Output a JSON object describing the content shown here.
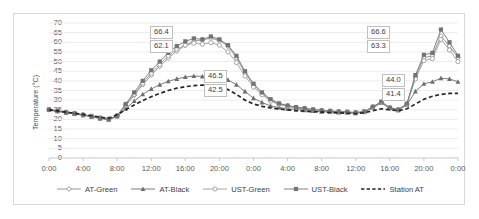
{
  "chart_data": {
    "type": "line",
    "title": "",
    "xlabel": "",
    "ylabel": "Temperature (°C)",
    "ylim": [
      0,
      70
    ],
    "ytick_step": 5,
    "yticks": [
      "70",
      "65",
      "60",
      "55",
      "50",
      "45",
      "40",
      "35",
      "30",
      "25",
      "20",
      "15",
      "10",
      "5",
      "0"
    ],
    "grid": true,
    "legend_position": "bottom",
    "xticks": [
      "0:00",
      "4:00",
      "8:00",
      "12:00",
      "16:00",
      "20:00",
      "0:00",
      "4:00",
      "8:00",
      "12:00",
      "16:00",
      "20:00",
      "0:00"
    ],
    "x_hours": [
      0,
      1,
      2,
      3,
      4,
      5,
      6,
      7,
      8,
      9,
      10,
      11,
      12,
      13,
      14,
      15,
      16,
      17,
      18,
      19,
      20,
      21,
      22,
      23,
      24,
      25,
      26,
      27,
      28,
      29,
      30,
      31,
      32,
      33,
      34,
      35,
      36,
      37,
      38,
      39,
      40,
      41,
      42,
      43,
      44,
      45,
      46,
      47,
      48
    ],
    "series": [
      {
        "name": "AT-Green",
        "marker": "open-diamond",
        "color": "#8c8c8c",
        "values": [
          25.0,
          24.3,
          23.6,
          23.0,
          22.4,
          21.6,
          20.7,
          20.1,
          21.8,
          27.0,
          32.5,
          38.0,
          43.0,
          47.5,
          51.8,
          55.5,
          58.4,
          60.5,
          61.3,
          62.1,
          61.0,
          58.0,
          52.0,
          44.0,
          38.0,
          33.5,
          30.0,
          28.0,
          27.0,
          26.2,
          25.6,
          25.0,
          24.6,
          24.3,
          24.0,
          23.8,
          23.5,
          24.0,
          26.5,
          29.0,
          26.0,
          25.0,
          28.0,
          42.0,
          52.0,
          53.0,
          63.3,
          58.0,
          52.0
        ]
      },
      {
        "name": "AT-Black",
        "marker": "filled-triangle",
        "color": "#6e6e6e",
        "values": [
          25.0,
          24.2,
          23.5,
          22.8,
          22.2,
          21.4,
          20.5,
          19.9,
          21.5,
          25.5,
          29.5,
          33.0,
          35.8,
          38.0,
          39.8,
          41.0,
          42.0,
          42.5,
          42.3,
          42.5,
          41.8,
          40.5,
          38.0,
          34.5,
          31.0,
          28.8,
          27.0,
          26.2,
          25.6,
          25.2,
          24.8,
          24.4,
          24.0,
          23.8,
          23.6,
          23.4,
          23.2,
          23.8,
          26.0,
          28.5,
          25.8,
          24.8,
          27.5,
          34.5,
          38.5,
          39.5,
          41.4,
          41.0,
          39.5
        ]
      },
      {
        "name": "UST-Green",
        "marker": "open-circle",
        "color": "#9e9e9e",
        "values": [
          25.2,
          24.5,
          23.8,
          23.2,
          22.5,
          21.8,
          20.9,
          20.3,
          22.0,
          27.5,
          33.0,
          38.8,
          44.0,
          48.5,
          53.0,
          56.5,
          58.5,
          59.5,
          59.0,
          59.8,
          58.5,
          55.0,
          49.5,
          42.5,
          36.8,
          32.8,
          29.5,
          27.8,
          26.8,
          26.0,
          25.4,
          24.9,
          24.5,
          24.2,
          23.9,
          23.7,
          23.4,
          23.9,
          26.3,
          28.8,
          25.9,
          24.9,
          27.8,
          41.0,
          50.5,
          51.5,
          61.5,
          56.0,
          50.0
        ]
      },
      {
        "name": "UST-Black",
        "marker": "filled-square",
        "color": "#737373",
        "values": [
          25.1,
          24.4,
          23.7,
          23.1,
          22.3,
          21.5,
          20.6,
          20.0,
          21.9,
          28.0,
          34.0,
          40.0,
          45.5,
          50.0,
          54.5,
          58.0,
          60.5,
          62.0,
          61.5,
          63.0,
          61.5,
          58.5,
          53.0,
          45.0,
          38.5,
          34.0,
          30.5,
          28.3,
          27.2,
          26.4,
          25.8,
          25.2,
          24.7,
          24.4,
          24.1,
          23.9,
          23.6,
          24.1,
          26.6,
          29.2,
          26.1,
          25.1,
          28.2,
          43.0,
          53.5,
          54.5,
          66.6,
          60.0,
          53.0
        ]
      },
      {
        "name": "Station AT",
        "marker": "dashed",
        "color": "#262626",
        "values": [
          25.0,
          24.4,
          23.8,
          23.2,
          22.6,
          21.9,
          21.2,
          20.6,
          22.5,
          25.0,
          27.5,
          29.8,
          31.8,
          33.5,
          35.0,
          36.2,
          37.0,
          37.5,
          37.8,
          37.6,
          37.0,
          35.5,
          33.0,
          30.0,
          28.0,
          26.8,
          26.0,
          25.4,
          25.0,
          24.6,
          24.3,
          24.0,
          23.8,
          23.6,
          23.4,
          23.2,
          23.0,
          23.5,
          24.5,
          25.5,
          25.0,
          24.5,
          25.5,
          28.0,
          30.5,
          32.0,
          33.0,
          33.5,
          33.5
        ]
      }
    ],
    "callouts": [
      {
        "id": "d1-max-ust-black",
        "value": "66.4"
      },
      {
        "id": "d1-max-at-green",
        "value": "62.1"
      },
      {
        "id": "d1-max-at-black",
        "value": "46.5"
      },
      {
        "id": "d1-max-ust-green",
        "value": "42.5"
      },
      {
        "id": "d2-max-ust-black",
        "value": "66.6"
      },
      {
        "id": "d2-max-at-green",
        "value": "63.3"
      },
      {
        "id": "d2-max-at-black",
        "value": "44.0"
      },
      {
        "id": "d2-max-ust-green",
        "value": "41.4"
      }
    ]
  }
}
